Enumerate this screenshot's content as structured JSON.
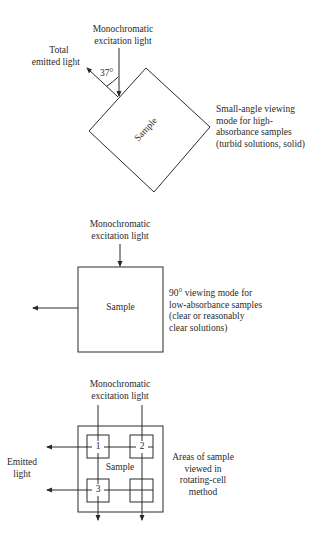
{
  "panel1": {
    "excitation_label_1": "Monochromatic",
    "excitation_label_2": "excitation light",
    "emitted_label_1": "Total",
    "emitted_label_2": "emitted light",
    "angle_label": "37°",
    "sample_label": "Sample",
    "caption_lines": [
      "Small-angle viewing",
      "mode for high-",
      "absorbance samples",
      "(turbid solutions, solid)"
    ]
  },
  "panel2": {
    "excitation_label_1": "Monochromatic",
    "excitation_label_2": "excitation light",
    "sample_label": "Sample",
    "caption_lines": [
      "90° viewing mode for",
      "low-absorbance samples",
      "(clear or reasonably",
      "clear solutions)"
    ]
  },
  "panel3": {
    "excitation_label_1": "Monochromatic",
    "excitation_label_2": "excitation light",
    "emitted_label_1": "Emitted",
    "emitted_label_2": "light",
    "sample_label": "Sample",
    "area_labels": [
      "1",
      "2",
      "3",
      ""
    ],
    "caption_lines": [
      "Areas of sample",
      "viewed in",
      "rotating-cell",
      "method"
    ]
  }
}
